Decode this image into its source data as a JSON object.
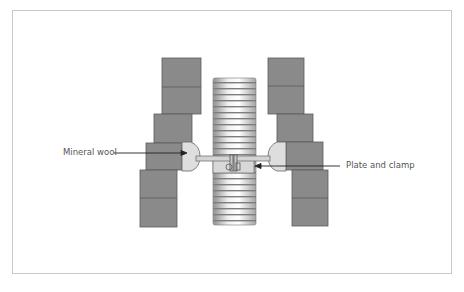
{
  "diagram": {
    "labels": {
      "mineral_wool": "Mineral wool",
      "plate_and_clamp": "Plate and clamp"
    },
    "colors": {
      "block_fill": "#8a8a8a",
      "block_stroke": "#555555",
      "pipe_light": "#e6e6e6",
      "pipe_dark": "#8c8c8c",
      "wool_fill": "#dedede",
      "plate_fill": "#d4d4d4",
      "frame_border": "#c8c8c8",
      "label_text": "#555555"
    }
  }
}
